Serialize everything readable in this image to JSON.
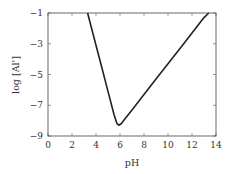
{
  "chart_data": {
    "type": "line",
    "title": "",
    "xlabel": "pH",
    "ylabel": "log [Al']",
    "xlim": [
      0,
      14
    ],
    "ylim": [
      -9,
      -1
    ],
    "xticks": [
      0,
      2,
      4,
      6,
      8,
      10,
      12,
      14
    ],
    "yticks": [
      -1,
      -3,
      -5,
      -7,
      -9
    ],
    "xtick_labels": [
      "0",
      "2",
      "4",
      "6",
      "8",
      "10",
      "12",
      "14"
    ],
    "ytick_labels": [
      "−1",
      "−3",
      "−5",
      "−7",
      "−9"
    ],
    "grid": false,
    "legend": null,
    "series": [
      {
        "name": "log [Al']",
        "color": "#222222",
        "x": [
          3.3,
          4.0,
          4.5,
          5.0,
          5.5,
          5.75,
          5.9,
          6.1,
          6.5,
          7.0,
          8.0,
          9.0,
          10.0,
          11.0,
          12.0,
          13.0,
          13.4
        ],
        "y": [
          -1.0,
          -3.1,
          -4.6,
          -6.1,
          -7.6,
          -8.2,
          -8.3,
          -8.2,
          -7.8,
          -7.3,
          -6.3,
          -5.3,
          -4.3,
          -3.3,
          -2.3,
          -1.3,
          -1.0
        ]
      }
    ]
  },
  "labels": {
    "xlabel": "pH",
    "ylabel": "log [Al']"
  }
}
